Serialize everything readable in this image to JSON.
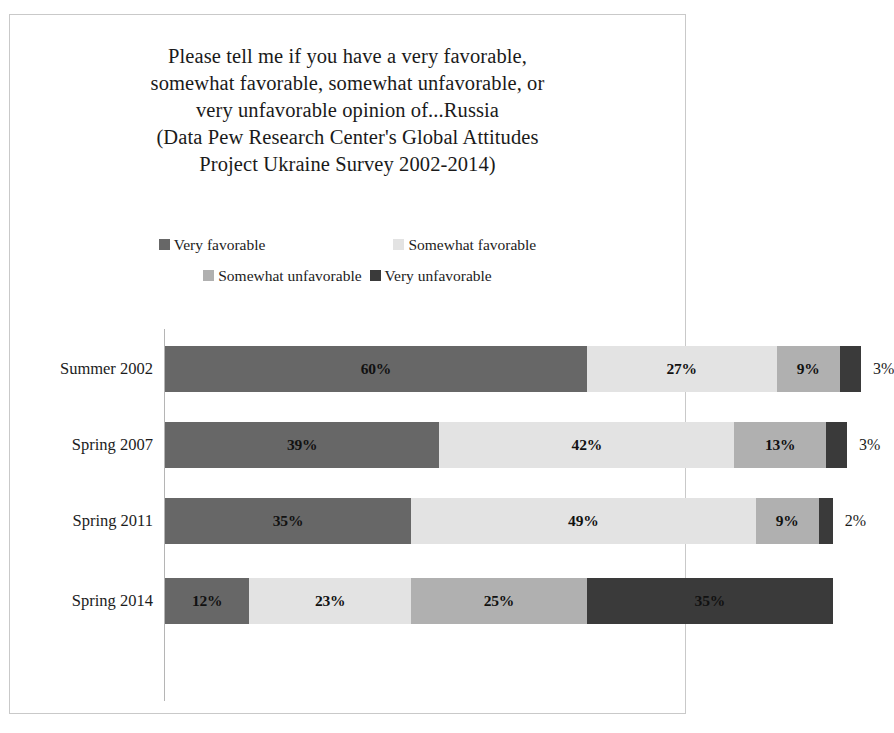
{
  "chart_data": {
    "type": "bar",
    "subtype": "horizontal-stacked-100",
    "title_lines": [
      "Please tell me if you have a very favorable,",
      "somewhat favorable, somewhat unfavorable, or",
      "very unfavorable opinion of...Russia",
      "(Data Pew Research Center's Global Attitudes",
      "Project Ukraine Survey 2002-2014)"
    ],
    "xlabel": "",
    "ylabel": "",
    "grid": false,
    "legend_position": "top-center",
    "categories": [
      "Summer 2002",
      "Spring 2007",
      "Spring 2011",
      "Spring 2014"
    ],
    "series": [
      {
        "name": "Very favorable",
        "color": "#676767",
        "values": [
          60,
          39,
          35,
          12
        ]
      },
      {
        "name": "Somewhat favorable",
        "color": "#e3e3e3",
        "values": [
          27,
          42,
          49,
          23
        ]
      },
      {
        "name": "Somewhat unfavorable",
        "color": "#b0b0b0",
        "values": [
          9,
          13,
          9,
          25
        ]
      },
      {
        "name": "Very unfavorable",
        "color": "#3a3a3a",
        "values": [
          3,
          3,
          2,
          35
        ]
      }
    ],
    "rows": [
      {
        "category": "Summer 2002",
        "segments": [
          {
            "series": "Very favorable",
            "value": 60,
            "label": "60%",
            "color": "#676767",
            "label_inside": true
          },
          {
            "series": "Somewhat favorable",
            "value": 27,
            "label": "27%",
            "color": "#e3e3e3",
            "label_inside": true
          },
          {
            "series": "Somewhat unfavorable",
            "value": 9,
            "label": "9%",
            "color": "#b0b0b0",
            "label_inside": true
          },
          {
            "series": "Very unfavorable",
            "value": 3,
            "label": "3%",
            "color": "#3a3a3a",
            "label_inside": false
          }
        ]
      },
      {
        "category": "Spring 2007",
        "segments": [
          {
            "series": "Very favorable",
            "value": 39,
            "label": "39%",
            "color": "#676767",
            "label_inside": true
          },
          {
            "series": "Somewhat favorable",
            "value": 42,
            "label": "42%",
            "color": "#e3e3e3",
            "label_inside": true
          },
          {
            "series": "Somewhat unfavorable",
            "value": 13,
            "label": "13%",
            "color": "#b0b0b0",
            "label_inside": true
          },
          {
            "series": "Very unfavorable",
            "value": 3,
            "label": "3%",
            "color": "#3a3a3a",
            "label_inside": false
          }
        ]
      },
      {
        "category": "Spring 2011",
        "segments": [
          {
            "series": "Very favorable",
            "value": 35,
            "label": "35%",
            "color": "#676767",
            "label_inside": true
          },
          {
            "series": "Somewhat favorable",
            "value": 49,
            "label": "49%",
            "color": "#e3e3e3",
            "label_inside": true
          },
          {
            "series": "Somewhat unfavorable",
            "value": 9,
            "label": "9%",
            "color": "#b0b0b0",
            "label_inside": true
          },
          {
            "series": "Very unfavorable",
            "value": 2,
            "label": "2%",
            "color": "#3a3a3a",
            "label_inside": false
          }
        ]
      },
      {
        "category": "Spring 2014",
        "segments": [
          {
            "series": "Very favorable",
            "value": 12,
            "label": "12%",
            "color": "#676767",
            "label_inside": true
          },
          {
            "series": "Somewhat favorable",
            "value": 23,
            "label": "23%",
            "color": "#e3e3e3",
            "label_inside": true
          },
          {
            "series": "Somewhat unfavorable",
            "value": 25,
            "label": "25%",
            "color": "#b0b0b0",
            "label_inside": true
          },
          {
            "series": "Very unfavorable",
            "value": 35,
            "label": "35%",
            "color": "#3a3a3a",
            "label_inside": true
          }
        ]
      }
    ],
    "legend": [
      {
        "label": "Very favorable",
        "color": "#676767"
      },
      {
        "label": "Somewhat favorable",
        "color": "#e3e3e3"
      },
      {
        "label": "Somewhat unfavorable",
        "color": "#b0b0b0"
      },
      {
        "label": "Very unfavorable",
        "color": "#3a3a3a"
      }
    ],
    "scale": {
      "pixels_per_percent": 7.03,
      "bar_origin_px": 155
    }
  }
}
